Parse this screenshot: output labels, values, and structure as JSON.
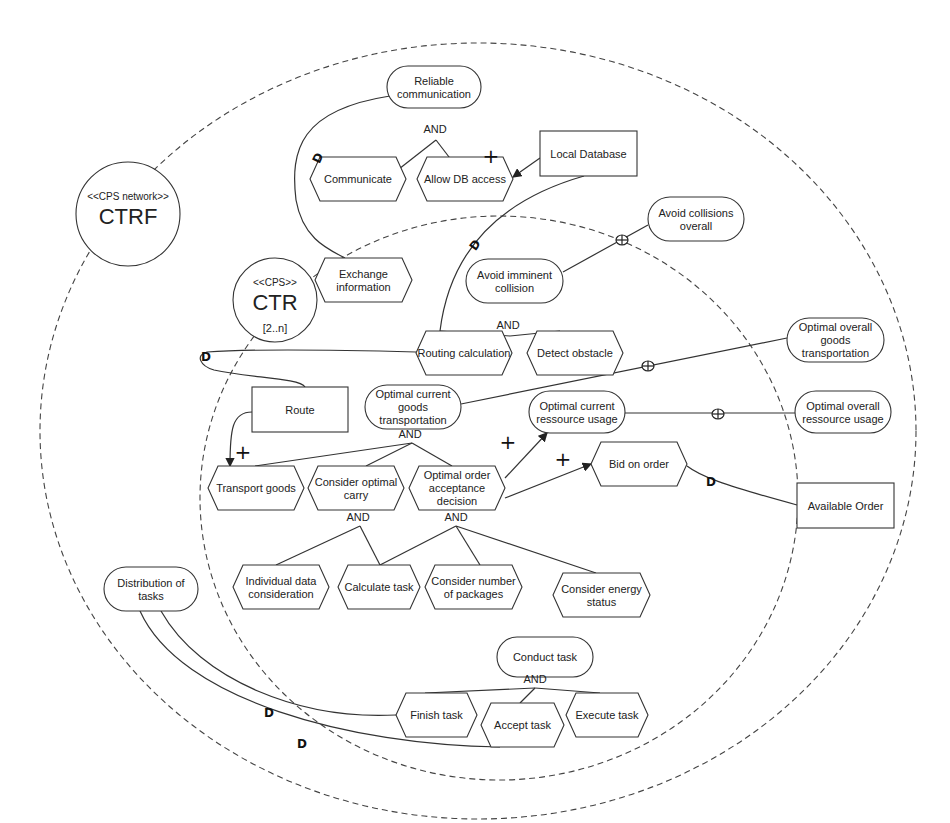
{
  "diagram": {
    "boundaries": [
      {
        "id": "ctrf-boundary",
        "cx": 478,
        "cy": 431,
        "rx": 438,
        "ry": 388
      },
      {
        "id": "ctr-boundary",
        "cx": 499,
        "cy": 498,
        "rx": 299,
        "ry": 282
      }
    ],
    "actors": [
      {
        "id": "ctrf",
        "cx": 128,
        "cy": 214,
        "r": 52,
        "stereotype": "<<CPS network>>",
        "name": "CTRF",
        "multiplicity": ""
      },
      {
        "id": "ctr",
        "cx": 275,
        "cy": 300,
        "r": 42,
        "stereotype": "<<CPS>>",
        "name": "CTR",
        "multiplicity": "[2..n]"
      }
    ],
    "nodes": [
      {
        "id": "reliable-communication",
        "type": "softgoal",
        "x": 387,
        "y": 66,
        "w": 94,
        "h": 42,
        "lines": [
          "Reliable",
          "communication"
        ]
      },
      {
        "id": "communicate",
        "type": "task",
        "x": 310,
        "y": 157,
        "w": 96,
        "h": 44,
        "lines": [
          "Communicate"
        ]
      },
      {
        "id": "allow-db-access",
        "type": "task",
        "x": 417,
        "y": 157,
        "w": 96,
        "h": 44,
        "lines": [
          "Allow DB access"
        ]
      },
      {
        "id": "local-database",
        "type": "resource",
        "x": 540,
        "y": 131,
        "w": 97,
        "h": 45,
        "lines": [
          "Local Database"
        ]
      },
      {
        "id": "avoid-collisions-overall",
        "type": "softgoal",
        "x": 648,
        "y": 197,
        "w": 96,
        "h": 44,
        "lines": [
          "Avoid collisions",
          "overall"
        ]
      },
      {
        "id": "exchange-information",
        "type": "task",
        "x": 315,
        "y": 258,
        "w": 97,
        "h": 44,
        "lines": [
          "Exchange",
          "information"
        ]
      },
      {
        "id": "avoid-imminent-collision",
        "type": "softgoal",
        "x": 466,
        "y": 259,
        "w": 97,
        "h": 44,
        "lines": [
          "Avoid imminent",
          "collision"
        ]
      },
      {
        "id": "routing-calculation",
        "type": "task",
        "x": 416,
        "y": 331,
        "w": 96,
        "h": 44,
        "lines": [
          "Routing calculation"
        ]
      },
      {
        "id": "detect-obstacle",
        "type": "task",
        "x": 527,
        "y": 331,
        "w": 96,
        "h": 44,
        "lines": [
          "Detect obstacle"
        ]
      },
      {
        "id": "optimal-overall-goods-transportation",
        "type": "softgoal",
        "x": 787,
        "y": 318,
        "w": 97,
        "h": 44,
        "lines": [
          "Optimal overall",
          "goods",
          "transportation"
        ]
      },
      {
        "id": "route",
        "type": "resource",
        "x": 252,
        "y": 387,
        "w": 96,
        "h": 45,
        "lines": [
          "Route"
        ]
      },
      {
        "id": "optimal-current-goods-transportation",
        "type": "softgoal",
        "x": 365,
        "y": 385,
        "w": 96,
        "h": 44,
        "lines": [
          "Optimal current",
          "goods",
          "transportation"
        ]
      },
      {
        "id": "optimal-current-ressource-usage",
        "type": "softgoal",
        "x": 529,
        "y": 391,
        "w": 96,
        "h": 42,
        "lines": [
          "Optimal current",
          "ressource usage"
        ]
      },
      {
        "id": "optimal-overall-ressource-usage",
        "type": "softgoal",
        "x": 795,
        "y": 391,
        "w": 96,
        "h": 42,
        "lines": [
          "Optimal overall",
          "ressource usage"
        ]
      },
      {
        "id": "bid-on-order",
        "type": "task",
        "x": 591,
        "y": 442,
        "w": 96,
        "h": 44,
        "lines": [
          "Bid on order"
        ]
      },
      {
        "id": "transport-goods",
        "type": "task",
        "x": 208,
        "y": 466,
        "w": 96,
        "h": 44,
        "lines": [
          "Transport goods"
        ]
      },
      {
        "id": "consider-optimal-carry",
        "type": "task",
        "x": 308,
        "y": 466,
        "w": 96,
        "h": 44,
        "lines": [
          "Consider optimal",
          "carry"
        ]
      },
      {
        "id": "optimal-order-acceptance-decision",
        "type": "task",
        "x": 409,
        "y": 466,
        "w": 96,
        "h": 44,
        "lines": [
          "Optimal order",
          "acceptance",
          "decision"
        ]
      },
      {
        "id": "available-order",
        "type": "resource",
        "x": 797,
        "y": 483,
        "w": 97,
        "h": 45,
        "lines": [
          "Available Order"
        ]
      },
      {
        "id": "individual-data-consideration",
        "type": "task",
        "x": 233,
        "y": 565,
        "w": 96,
        "h": 44,
        "lines": [
          "Individual data",
          "consideration"
        ]
      },
      {
        "id": "calculate-task",
        "type": "task",
        "x": 338,
        "y": 565,
        "w": 82,
        "h": 44,
        "lines": [
          "Calculate task"
        ]
      },
      {
        "id": "consider-number-of-packages",
        "type": "task",
        "x": 425,
        "y": 565,
        "w": 97,
        "h": 44,
        "lines": [
          "Consider number",
          "of packages"
        ]
      },
      {
        "id": "consider-energy-status",
        "type": "task",
        "x": 553,
        "y": 573,
        "w": 97,
        "h": 44,
        "lines": [
          "Consider energy",
          "status"
        ]
      },
      {
        "id": "distribution-of-tasks",
        "type": "softgoal",
        "x": 104,
        "y": 567,
        "w": 94,
        "h": 44,
        "lines": [
          "Distribution of",
          "tasks"
        ]
      },
      {
        "id": "conduct-task",
        "type": "softgoal",
        "x": 497,
        "y": 637,
        "w": 96,
        "h": 40,
        "lines": [
          "Conduct task"
        ]
      },
      {
        "id": "finish-task",
        "type": "task",
        "x": 396,
        "y": 693,
        "w": 81,
        "h": 44,
        "lines": [
          "Finish task"
        ]
      },
      {
        "id": "accept-task",
        "type": "task",
        "x": 481,
        "y": 703,
        "w": 83,
        "h": 44,
        "lines": [
          "Accept task"
        ]
      },
      {
        "id": "execute-task",
        "type": "task",
        "x": 566,
        "y": 693,
        "w": 82,
        "h": 44,
        "lines": [
          "Execute task"
        ]
      }
    ],
    "and_labels": [
      {
        "x": 435,
        "y": 133,
        "text": "AND"
      },
      {
        "x": 508,
        "y": 329,
        "text": "AND"
      },
      {
        "x": 410,
        "y": 438,
        "text": "AND"
      },
      {
        "x": 358,
        "y": 521,
        "text": "AND"
      },
      {
        "x": 456,
        "y": 521,
        "text": "AND"
      },
      {
        "x": 535,
        "y": 683,
        "text": "AND"
      }
    ],
    "plus_labels": [
      {
        "x": 491,
        "y": 163,
        "text": "+"
      },
      {
        "x": 243,
        "y": 459,
        "text": "+"
      },
      {
        "x": 508,
        "y": 449,
        "text": "+"
      },
      {
        "x": 563,
        "y": 466,
        "text": "+"
      }
    ],
    "dependency_markers": [
      {
        "x": 318,
        "y": 158,
        "text": "D",
        "rot": -65
      },
      {
        "x": 475,
        "y": 245,
        "text": "D",
        "rot": -55
      },
      {
        "x": 206,
        "y": 357,
        "text": "D",
        "rot": 0
      },
      {
        "x": 711,
        "y": 482,
        "text": "D",
        "rot": 0
      },
      {
        "x": 269,
        "y": 713,
        "text": "D",
        "rot": 0
      },
      {
        "x": 302,
        "y": 744,
        "text": "D",
        "rot": 0
      }
    ],
    "contribution_markers": [
      {
        "x": 622,
        "y": 240
      },
      {
        "x": 648,
        "y": 366
      },
      {
        "x": 718,
        "y": 414
      }
    ],
    "edges": [
      {
        "id": "and-comm",
        "d": "M 376 187 L 436 140"
      },
      {
        "id": "and-dbaccess",
        "d": "M 472 187 L 436 140"
      },
      {
        "id": "localdb-to-dbaccess",
        "d": "M 540 158 L 513 177",
        "arrow": true
      },
      {
        "id": "dep-reliable-exchange",
        "d": "M 390 96 C 300 110, 290 150, 296 200 C 303 240, 330 250, 345 258"
      },
      {
        "id": "dep-localdb-routing",
        "d": "M 584 176 C 500 200, 450 250, 440 331"
      },
      {
        "id": "contrib-avoid",
        "d": "M 563 272 L 648 225"
      },
      {
        "id": "and-routing",
        "d": "M 440 331 L 510 336"
      },
      {
        "id": "and-obstacle",
        "d": "M 560 331 L 510 336"
      },
      {
        "id": "dep-route-routing",
        "d": "M 416 352 C 340 350, 250 349, 207 352 C 195 355, 200 366, 214 370 C 250 378, 300 378, 305 387"
      },
      {
        "id": "route-to-transport",
        "d": "M 252 412 C 232 412, 230 430, 230 466",
        "arrow": true
      },
      {
        "id": "contrib-goods-overall",
        "d": "M 461 404 L 787 338"
      },
      {
        "id": "contrib-ressource-overall",
        "d": "M 625 413 L 795 413"
      },
      {
        "id": "and-transport",
        "d": "M 255 466 L 412 443"
      },
      {
        "id": "and-carry",
        "d": "M 366 466 L 412 443"
      },
      {
        "id": "and-order",
        "d": "M 452 466 L 412 443"
      },
      {
        "id": "order-to-resusage",
        "d": "M 505 478 L 547 433",
        "arrow": true
      },
      {
        "id": "order-to-bid",
        "d": "M 505 498 L 591 464",
        "arrow": true
      },
      {
        "id": "dep-bid-available",
        "d": "M 687 466 C 700 476, 720 484, 797 505"
      },
      {
        "id": "and-indiv",
        "d": "M 276 565 L 360 526"
      },
      {
        "id": "and-calc1",
        "d": "M 380 565 L 360 526"
      },
      {
        "id": "and-calc2",
        "d": "M 380 565 L 456 526"
      },
      {
        "id": "and-packages",
        "d": "M 480 565 L 456 526"
      },
      {
        "id": "and-energy",
        "d": "M 596 573 L 456 526"
      },
      {
        "id": "dep-dist-finish",
        "d": "M 161 611 C 200 680, 300 720, 396 715"
      },
      {
        "id": "dep-dist-accept",
        "d": "M 140 611 C 180 700, 350 745, 500 747"
      },
      {
        "id": "and-finish",
        "d": "M 425 693 L 535 688"
      },
      {
        "id": "and-accept",
        "d": "M 520 703 L 535 688"
      },
      {
        "id": "and-execute",
        "d": "M 600 693 L 535 688"
      }
    ]
  }
}
